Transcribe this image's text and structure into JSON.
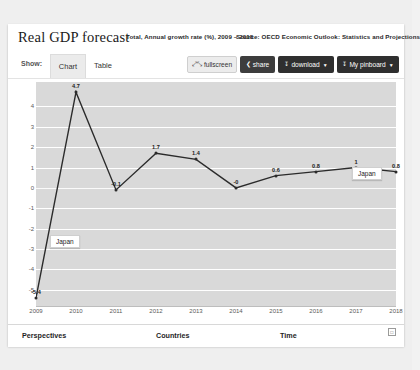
{
  "header": {
    "title": "Real GDP forecast",
    "subtitle": "Total, Annual growth rate (%), 2009 – 2018",
    "source": "Source: OECD Economic Outlook: Statistics and Projections"
  },
  "toolbar": {
    "show_label": "Show:",
    "tab_chart": "Chart",
    "tab_table": "Table",
    "fullscreen_label": "fullscreen",
    "fullscreen_icon": "expand-icon",
    "share_label": "share",
    "share_icon": "share-icon",
    "download_label": "download",
    "download_icon": "download-icon",
    "pinboard_label": "My pinboard",
    "pinboard_icon": "pin-icon",
    "caret": "▼"
  },
  "tooltips": {
    "left": "Japan",
    "right": "Japan"
  },
  "bottom_nav": {
    "perspectives": "Perspectives",
    "countries": "Countries",
    "time": "Time",
    "corner_icon": "copy-icon"
  },
  "chart_data": {
    "type": "line",
    "title": "Real GDP forecast",
    "subtitle": "Total, Annual growth rate (%), 2009 – 2018",
    "source": "Source: OECD Economic Outlook: Statistics and Projections",
    "series_name": "Japan",
    "xlabel": "",
    "ylabel": "",
    "x": [
      2009,
      2010,
      2011,
      2012,
      2013,
      2014,
      2015,
      2016,
      2017,
      2018
    ],
    "xticklabels": [
      "2009",
      "2010",
      "2011",
      "2012",
      "2013",
      "2014",
      "2015",
      "2016",
      "2017",
      "2018"
    ],
    "values": [
      -5.4,
      4.7,
      -0.1,
      1.7,
      1.4,
      -0.0,
      0.6,
      0.8,
      1.0,
      0.8
    ],
    "point_labels": [
      "-5.4",
      "4.7",
      "-0.1",
      "1.7",
      "1.4",
      "-0",
      "0.6",
      "0.8",
      "1",
      "0.8"
    ],
    "yticklabels": [
      "4",
      "3",
      "2",
      "1",
      "0",
      "-1",
      "-2",
      "-3",
      "-4",
      "-5"
    ],
    "yticks": [
      4,
      3,
      2,
      1,
      0,
      -1,
      -2,
      -3,
      -4,
      -5
    ],
    "ylim": [
      -5.8,
      5.2
    ],
    "grid": true,
    "legend": false,
    "line_color": "#2b2b2b",
    "plot_bg": "#d9d9d9",
    "grid_color": "#ffffff"
  }
}
